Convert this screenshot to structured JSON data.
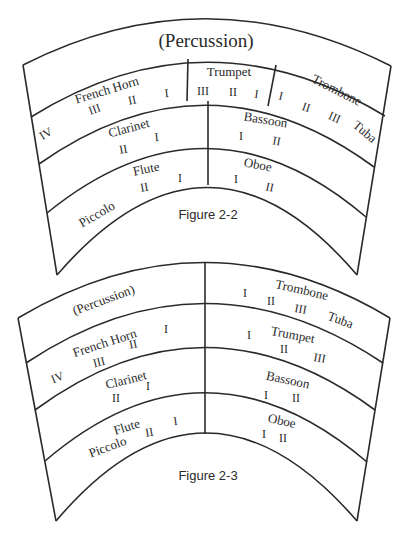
{
  "figures": [
    {
      "caption": "Figure 2-2",
      "rows": [
        {
          "label": "(Percussion)"
        },
        {
          "sections": [
            {
              "name": "French Horn",
              "parts": [
                "IV",
                "III",
                "II",
                "I"
              ]
            },
            {
              "name": "Trumpet",
              "parts": [
                "III",
                "II",
                "I"
              ]
            },
            {
              "name": "Trombone",
              "parts": [
                "I",
                "II",
                "III"
              ]
            },
            {
              "name": "Tuba"
            }
          ]
        },
        {
          "sections": [
            {
              "name": "Clarinet",
              "parts": [
                "II",
                "I"
              ]
            },
            {
              "name": "Bassoon",
              "parts": [
                "I",
                "II"
              ]
            }
          ]
        },
        {
          "sections": [
            {
              "name": "Flute",
              "parts": [
                "II",
                "I"
              ]
            },
            {
              "name": "Piccolo"
            },
            {
              "name": "Oboe",
              "parts": [
                "I",
                "II"
              ]
            }
          ]
        }
      ]
    },
    {
      "caption": "Figure 2-3",
      "left": [
        {
          "name": "(Percussion)"
        },
        {
          "name": "French Horn",
          "parts": [
            "IV",
            "III",
            "II",
            "I"
          ]
        },
        {
          "name": "Clarinet",
          "parts": [
            "II",
            "I"
          ]
        },
        {
          "name": "Flute",
          "parts": [
            "II",
            "I"
          ]
        },
        {
          "name": "Piccolo"
        }
      ],
      "right": [
        {
          "name": "Trombone",
          "parts": [
            "I",
            "II",
            "III"
          ]
        },
        {
          "name": "Tuba"
        },
        {
          "name": "Trumpet",
          "parts": [
            "I",
            "II",
            "III"
          ]
        },
        {
          "name": "Bassoon",
          "parts": [
            "I",
            "II"
          ]
        },
        {
          "name": "Oboe",
          "parts": [
            "I",
            "II"
          ]
        }
      ]
    }
  ]
}
